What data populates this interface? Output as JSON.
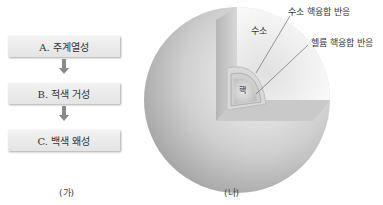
{
  "panel_a": {
    "caption": "(가)",
    "steps": [
      {
        "label": "A. 주계열성"
      },
      {
        "label": "B. 적색 거성"
      },
      {
        "label": "C. 백색 왜성"
      }
    ]
  },
  "panel_b": {
    "caption": "(나)",
    "labels": {
      "hydrogen": "수소",
      "hydrogen_fusion": "수소 핵융합 반응",
      "helium_fusion": "헬륨 핵융합 반응",
      "core": "핵"
    }
  }
}
